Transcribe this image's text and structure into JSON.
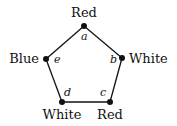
{
  "diagram": {
    "type": "pentagon-graph-coloring",
    "vertices": [
      {
        "id": "a",
        "label": "a",
        "color_name": "Red",
        "x": 84,
        "y": 26
      },
      {
        "id": "b",
        "label": "b",
        "color_name": "White",
        "x": 122,
        "y": 58
      },
      {
        "id": "c",
        "label": "c",
        "color_name": "Red",
        "x": 110,
        "y": 102
      },
      {
        "id": "d",
        "label": "d",
        "color_name": "White",
        "x": 62,
        "y": 102
      },
      {
        "id": "e",
        "label": "e",
        "color_name": "Blue",
        "x": 46,
        "y": 59
      }
    ],
    "edges": [
      [
        "a",
        "b"
      ],
      [
        "b",
        "c"
      ],
      [
        "c",
        "d"
      ],
      [
        "d",
        "e"
      ],
      [
        "e",
        "a"
      ]
    ]
  }
}
